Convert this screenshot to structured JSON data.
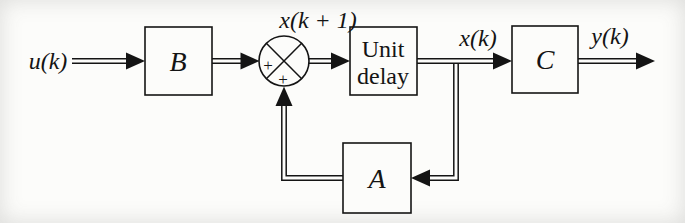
{
  "figure": {
    "type": "block-diagram",
    "colors": {
      "stroke": "#141414",
      "background": "#fcfcfa"
    },
    "labels": {
      "input": "u(k)",
      "state_next": "x(k + 1)",
      "state": "x(k)",
      "output": "y(k)",
      "gain_input": "B",
      "gain_feedback": "A",
      "gain_output": "C",
      "delay_line1": "Unit",
      "delay_line2": "delay",
      "plus_left": "+",
      "plus_bottom": "+"
    }
  }
}
